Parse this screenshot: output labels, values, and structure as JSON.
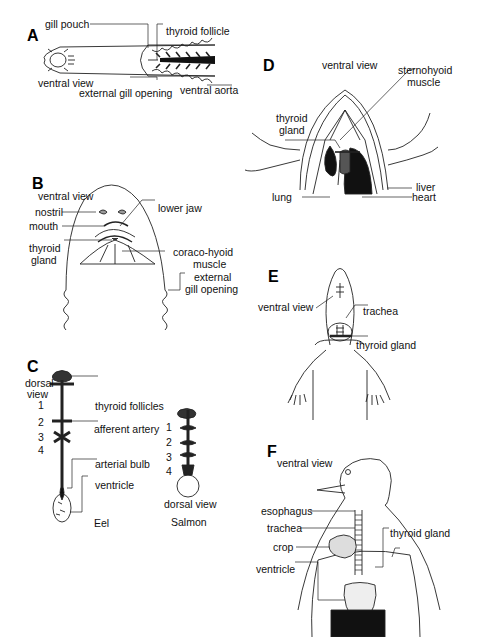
{
  "panels": {
    "A": {
      "letter": "A",
      "labels": {
        "gill_pouch": "gill pouch",
        "thyroid_follicle": "thyroid follicle",
        "ventral_view": "ventral view",
        "external_gill_opening": "external gill opening",
        "ventral_aorta": "ventral aorta"
      }
    },
    "B": {
      "letter": "B",
      "labels": {
        "ventral_view": "ventral view",
        "nostril": "nostril",
        "lower_jaw": "lower jaw",
        "mouth": "mouth",
        "thyroid_gland_1": "thyroid",
        "thyroid_gland_2": "gland",
        "coraco_hyoid_1": "coraco-hyoid",
        "coraco_hyoid_2": "muscle",
        "external_gill_1": "external",
        "external_gill_2": "gill opening"
      }
    },
    "C": {
      "letter": "C",
      "labels": {
        "dorsal_view_1": "dorsal",
        "dorsal_view_2": "view",
        "thyroid_follicles": "thyroid follicles",
        "afferent_artery": "afferent artery",
        "arterial_bulb": "arterial bulb",
        "ventricle": "ventricle",
        "eel": "Eel",
        "salmon_dorsal_view": "dorsal view",
        "salmon": "Salmon"
      },
      "eel_numbers": [
        "1",
        "2",
        "3",
        "4"
      ],
      "salmon_numbers": [
        "1",
        "2",
        "3",
        "4"
      ]
    },
    "D": {
      "letter": "D",
      "labels": {
        "ventral_view": "ventral view",
        "sternohyoid_1": "sternohyoid",
        "sternohyoid_2": "muscle",
        "thyroid_gland_1": "thyroid",
        "thyroid_gland_2": "gland",
        "liver": "liver",
        "lung": "lung",
        "heart": "heart"
      }
    },
    "E": {
      "letter": "E",
      "labels": {
        "ventral_view": "ventral view",
        "trachea": "trachea",
        "thyroid_gland": "thyroid gland"
      }
    },
    "F": {
      "letter": "F",
      "labels": {
        "ventral_view": "ventral view",
        "esophagus": "esophagus",
        "trachea": "trachea",
        "crop": "crop",
        "ventricle": "ventricle",
        "thyroid_gland": "thyroid gland"
      }
    }
  }
}
